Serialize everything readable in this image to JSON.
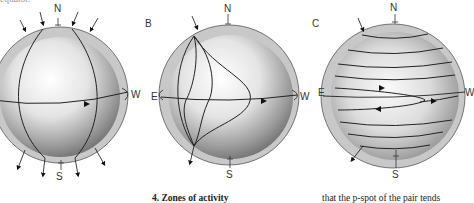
{
  "top_text_fragment": "equator.",
  "figures": [
    {
      "panel": "",
      "north": "N",
      "south": "S",
      "east": "",
      "west": "W"
    },
    {
      "panel": "B",
      "north": "N",
      "south": "S",
      "east": "E",
      "west": "W"
    },
    {
      "panel": "C",
      "north": "N",
      "south": "S",
      "east": "E",
      "west": "W"
    }
  ],
  "caption_heading": "4. Zones of activity",
  "body_text_fragment": "that the p-spot of the pair tends"
}
